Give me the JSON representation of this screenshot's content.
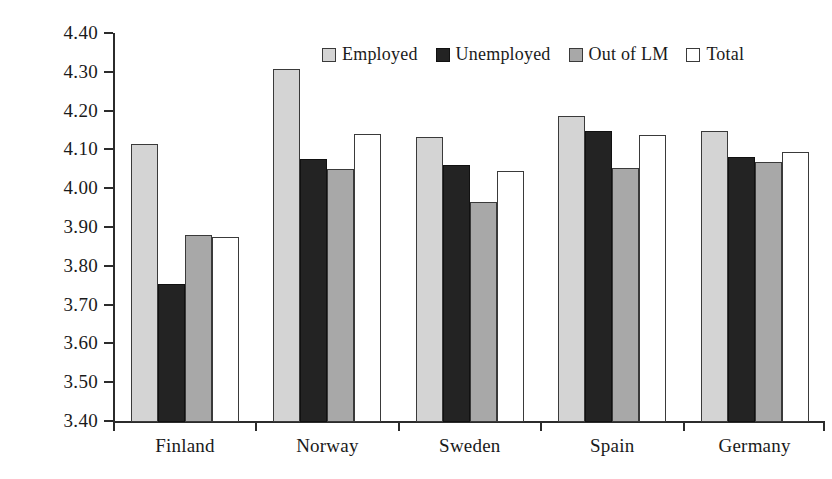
{
  "chart_data": {
    "type": "bar",
    "title": "",
    "subtitle": "",
    "xlabel": "",
    "ylabel": "Commitment score",
    "categories": [
      "Finland",
      "Norway",
      "Sweden",
      "Spain",
      "Germany"
    ],
    "series": [
      {
        "name": "Employed",
        "key": "employed",
        "color": "#d4d4d4",
        "values": [
          4.115,
          4.307,
          4.133,
          4.187,
          4.148
        ]
      },
      {
        "name": "Unemployed",
        "key": "unemployed",
        "color": "#232323",
        "values": [
          3.752,
          4.075,
          4.06,
          4.148,
          4.08
        ]
      },
      {
        "name": "Out of LM",
        "key": "outoflm",
        "color": "#a8a8a8",
        "values": [
          3.88,
          4.05,
          3.965,
          4.053,
          4.068
        ]
      },
      {
        "name": "Total",
        "key": "total",
        "color": "#ffffff",
        "values": [
          3.875,
          4.14,
          4.045,
          4.138,
          4.093
        ]
      }
    ],
    "ylim": [
      3.4,
      4.4
    ],
    "ytick_values": [
      3.4,
      3.5,
      3.6,
      3.7,
      3.8,
      3.9,
      4.0,
      4.1,
      4.2,
      4.3,
      4.4
    ],
    "ytick_labels": [
      "3.40",
      "3.50",
      "3.60",
      "3.70",
      "3.80",
      "3.90",
      "4.00",
      "4.10",
      "4.20",
      "4.30",
      "4.40"
    ],
    "grid": false,
    "legend_position": "top-center",
    "legend_entries": [
      "Employed",
      "Unemployed",
      "Out of LM",
      "Total"
    ]
  }
}
